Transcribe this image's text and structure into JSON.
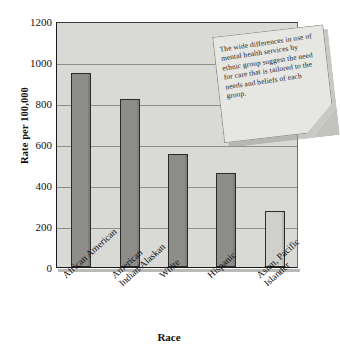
{
  "chart_data": {
    "type": "bar",
    "title": "",
    "xlabel": "Race",
    "ylabel": "Rate per 100,000",
    "categories": [
      "African American",
      "American\nIndian/Alaskan",
      "White",
      "Hispanic",
      "Asian, Pacific\nIslander"
    ],
    "values": [
      945,
      820,
      550,
      458,
      275
    ],
    "ylim": [
      0,
      1200
    ],
    "ytick_labels": [
      "0",
      "200",
      "400",
      "600",
      "800",
      "1000",
      "1200"
    ],
    "ytick_values": [
      0,
      200,
      400,
      600,
      800,
      1000,
      1200
    ],
    "grid": true,
    "legend": "none",
    "colors": {
      "plot_background": "#d9d9d6",
      "bar_fill": "#8d8d8a",
      "bar_fill_light": "#cfcfcb",
      "bar_outline": "#2b2b2b",
      "gridline": "#8e8e8b",
      "axis": "#1a1a1a",
      "text": "#111111",
      "note_paper": "#e6e6e2",
      "note_fold": "#c3c3bd"
    },
    "bar_styles": [
      "dark",
      "dark",
      "dark",
      "dark",
      "light"
    ]
  },
  "annotation": {
    "text": "The wide differences in use of mental health services by ethnic group suggest the need for care that is tailored to the needs and beliefs of each group."
  }
}
